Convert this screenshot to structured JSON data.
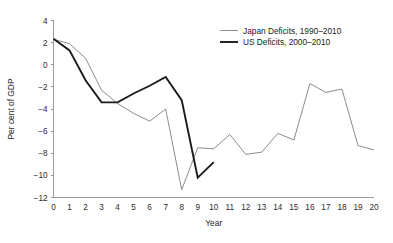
{
  "chart_data": {
    "type": "line",
    "title": "",
    "xlabel": "Year",
    "ylabel": "Per cent of GDP",
    "xlim": [
      0,
      20
    ],
    "ylim": [
      -12,
      4
    ],
    "xticks": [
      0,
      1,
      2,
      3,
      4,
      5,
      6,
      7,
      8,
      9,
      10,
      11,
      12,
      13,
      14,
      15,
      16,
      17,
      18,
      19,
      20
    ],
    "yticks": [
      4,
      2,
      0,
      -2,
      -4,
      -6,
      -8,
      -10,
      -12
    ],
    "ytick_labels": [
      "4",
      "2",
      "0",
      "-2",
      "-4",
      "-6",
      "-8",
      "-10",
      "-12"
    ],
    "xtick_labels": [
      "0",
      "1",
      "2",
      "3",
      "4",
      "5",
      "6",
      "7",
      "8",
      "9",
      "10",
      "11",
      "12",
      "13",
      "14",
      "15",
      "16",
      "17",
      "18",
      "19",
      "20"
    ],
    "grid": false,
    "legend_position": "top-right",
    "series": [
      {
        "name": "Japan Deficits, 1990-2010",
        "label": "Japan Deficits, 1990–2010",
        "color": "#8c8c8c",
        "width": 1.0,
        "x": [
          0,
          1,
          2,
          3,
          4,
          5,
          6,
          7,
          8,
          9,
          10,
          11,
          12,
          13,
          14,
          15,
          16,
          17,
          18,
          19,
          20
        ],
        "values": [
          2.3,
          1.9,
          0.6,
          -2.3,
          -3.5,
          -4.4,
          -5.1,
          -4.0,
          -11.3,
          -7.5,
          -7.6,
          -6.3,
          -8.1,
          -7.9,
          -6.2,
          -6.8,
          -1.7,
          -2.5,
          -2.2,
          -7.3,
          -7.7
        ]
      },
      {
        "name": "US Deficits, 2000-2010",
        "label": "US Deficits, 2000–2010",
        "color": "#1a1a1a",
        "width": 1.9,
        "x": [
          0,
          1,
          2,
          3,
          4,
          5,
          6,
          7,
          8,
          9,
          10
        ],
        "values": [
          2.35,
          1.3,
          -1.4,
          -3.4,
          -3.4,
          -2.6,
          -1.9,
          -1.1,
          -3.2,
          -10.2,
          -8.8
        ]
      }
    ]
  },
  "legend": {
    "entries": [
      {
        "label": "Japan Deficits, 1990–2010",
        "color": "#8c8c8c",
        "width": 1.0
      },
      {
        "label": "US Deficits, 2000–2010",
        "color": "#1a1a1a",
        "width": 1.9
      }
    ]
  },
  "axes": {
    "x_title": "Year",
    "y_title": "Per cent of GDP"
  }
}
